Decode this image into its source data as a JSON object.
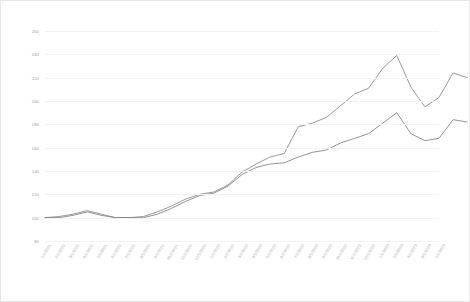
{
  "chart_data": {
    "type": "line",
    "title": "",
    "subtitle": "",
    "xlabel": "",
    "ylabel": "",
    "ylim": [
      80,
      260
    ],
    "yticks": [
      80,
      100,
      120,
      140,
      160,
      180,
      200,
      220,
      240,
      260
    ],
    "grid": true,
    "legend": "none",
    "x": [
      "1/1/2021",
      "2/1/2021",
      "3/1/2021",
      "4/1/2021",
      "5/1/2021",
      "6/1/2021",
      "7/1/2021",
      "8/1/2021",
      "9/1/2021",
      "10/1/2021",
      "11/1/2021",
      "12/1/2021",
      "1/1/2022",
      "2/1/2022",
      "3/1/2022",
      "4/1/2022",
      "5/1/2022",
      "6/1/2022",
      "7/1/2022",
      "8/1/2022",
      "9/1/2022",
      "10/1/2022",
      "11/1/2022",
      "12/1/2022",
      "1/1/2023",
      "2/1/2023",
      "3/1/2023",
      "4/1/2023",
      "5/1/2023"
    ],
    "series": [
      {
        "name": "Series 1",
        "color": "#808080",
        "values": [
          100,
          101,
          103,
          106,
          103,
          100,
          100,
          101,
          105,
          110,
          116,
          120,
          122,
          128,
          139,
          146,
          152,
          155,
          178,
          181,
          186,
          196,
          206,
          211,
          228,
          239,
          212,
          195,
          203
        ]
      },
      {
        "name": "Series 2",
        "color": "#787878",
        "values": [
          100,
          100,
          102,
          105,
          102,
          100,
          100,
          100,
          103,
          108,
          114,
          119,
          121,
          127,
          137,
          143,
          146,
          147,
          152,
          156,
          158,
          164,
          168,
          172,
          181,
          190,
          172,
          166,
          168
        ]
      }
    ],
    "series_tail": [
      {
        "name": "Series 1",
        "values": [
          224,
          220
        ]
      },
      {
        "name": "Series 2",
        "values": [
          184,
          182
        ]
      }
    ]
  },
  "axis": {
    "y_tick_labels": [
      "260",
      "240",
      "220",
      "200",
      "180",
      "160",
      "140",
      "120",
      "100",
      "80"
    ]
  }
}
